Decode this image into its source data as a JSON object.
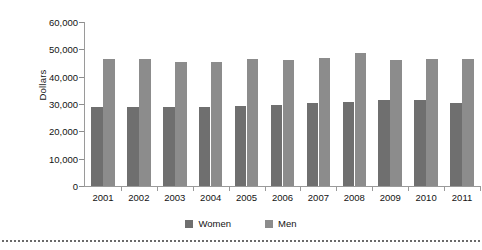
{
  "chart_data": {
    "type": "bar",
    "title": "",
    "subtitle": "",
    "xlabel": "",
    "ylabel": "Dollars",
    "ylim": [
      0,
      60000
    ],
    "ytick_values": [
      60000,
      50000,
      40000,
      30000,
      20000,
      10000,
      0
    ],
    "ytick_labels": [
      "60,000",
      "50,000",
      "40,000",
      "30,000",
      "20,000",
      "10,000",
      "0"
    ],
    "grid": false,
    "legend_position": "bottom-center",
    "categories": [
      "2001",
      "2002",
      "2003",
      "2004",
      "2005",
      "2006",
      "2007",
      "2008",
      "2009",
      "2010",
      "2011"
    ],
    "series": [
      {
        "name": "Women",
        "color": "#6f6f6f",
        "values": [
          28900,
          28900,
          28800,
          28900,
          29300,
          29600,
          30300,
          30700,
          31500,
          31400,
          30400
        ]
      },
      {
        "name": "Men",
        "color": "#8c8c8c",
        "values": [
          46500,
          46400,
          45400,
          45500,
          46300,
          46200,
          47000,
          48600,
          46200,
          46400,
          46600
        ]
      }
    ]
  },
  "legend": {
    "items": [
      {
        "label": "Women",
        "color": "#6f6f6f"
      },
      {
        "label": "Men",
        "color": "#8c8c8c"
      }
    ]
  },
  "axis": {
    "ylabel": "Dollars"
  }
}
